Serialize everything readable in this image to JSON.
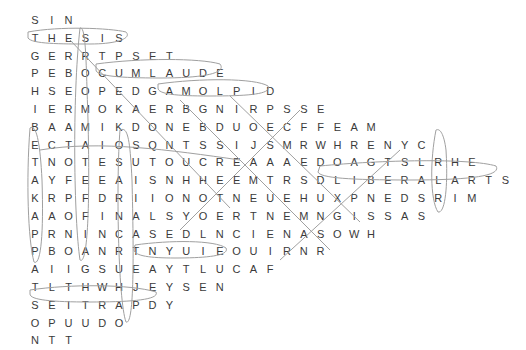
{
  "puzzle": {
    "rows": [
      "SIN",
      "THESIS",
      "GERRTPSET",
      "PEBOCUMLAUDE",
      "HSEOPEDGAMOLPID",
      "IERMOKAERBGNIRPSSE",
      "BAAMIKDONEBDUOECFFEAM",
      "ECTAIOSQNTSSIJSMRWHRENYC",
      "TNOTESUTOUCREAAAEDOAGTSLRHE",
      "AYFEEAISNHHEEMTRSDLIBERALARTS",
      "KRPFDRIIONOTNEUEHUXPNEDSRIM",
      "AAOFINALSYOERTNEMNGISSAS",
      "PRNINCASEDLNCIENASOWH",
      "PBOANRTNYUIEOUIRNR",
      "AIIGSUEAYTLUCAF",
      "TLTHWHJEYSEN",
      "SEITRAPDY",
      "OPUUDO",
      "NTT"
    ],
    "found_words_circled": [
      "THESIS",
      "CUMLAUDE",
      "AMOLPID",
      "LIBERALARTS",
      "FINALS",
      "PARTIES",
      "FACULTY",
      "NOTES"
    ],
    "ink_color": "#a0a0a0",
    "letter_color": "#3a3a3a"
  }
}
